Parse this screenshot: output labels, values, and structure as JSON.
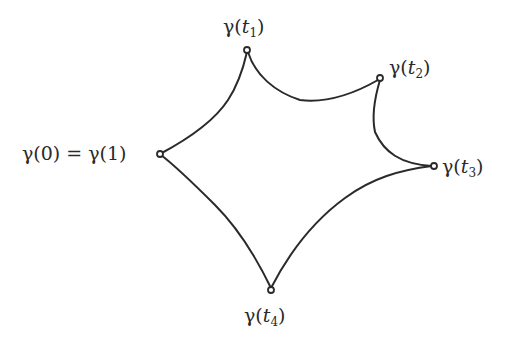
{
  "diagram": {
    "type": "closed-curve",
    "stroke_color": "#2a2a2a",
    "background": "#ffffff",
    "points": [
      {
        "id": "p0",
        "label_main": "γ(0) = γ(1)",
        "x": 160,
        "y": 154
      },
      {
        "id": "t1",
        "label_func": "γ(",
        "label_var": "t",
        "label_sub": "1",
        "label_close": ")",
        "x": 247,
        "y": 50
      },
      {
        "id": "t2",
        "label_func": "γ(",
        "label_var": "t",
        "label_sub": "2",
        "label_close": ")",
        "x": 380,
        "y": 78
      },
      {
        "id": "t3",
        "label_func": "γ(",
        "label_var": "t",
        "label_sub": "3",
        "label_close": ")",
        "x": 434,
        "y": 166
      },
      {
        "id": "t4",
        "label_func": "γ(",
        "label_var": "t",
        "label_sub": "4",
        "label_close": ")",
        "x": 271,
        "y": 290
      }
    ]
  }
}
